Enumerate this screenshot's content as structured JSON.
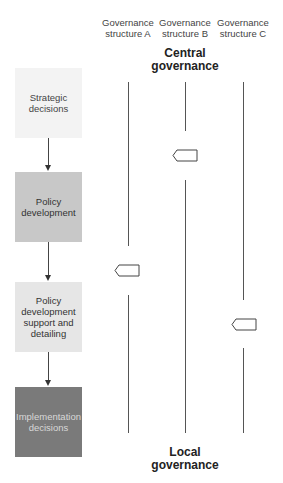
{
  "columns": [
    {
      "label_line1": "Governance",
      "label_line2": "structure A",
      "marker_level": "Policy development support and detailing (upper)"
    },
    {
      "label_line1": "Governance",
      "label_line2": "structure B",
      "marker_level": "Strategic decisions / Policy development"
    },
    {
      "label_line1": "Governance",
      "label_line2": "structure C",
      "marker_level": "Policy development support and detailing"
    }
  ],
  "central": {
    "line1": "Central",
    "line2": "governance"
  },
  "local": {
    "line1": "Local",
    "line2": "governance"
  },
  "boxes": [
    {
      "text_line1": "Strategic",
      "text_line2": "decisions",
      "bg": "#f3f3f3",
      "fg": "#444444"
    },
    {
      "text_line1": "Policy",
      "text_line2": "development",
      "bg": "#c8c8c8",
      "fg": "#333333"
    },
    {
      "text_line1": "Policy",
      "text_line2": "development",
      "text_line3": "support and",
      "text_line4": "detailing",
      "bg": "#e6e6e6",
      "fg": "#333333"
    },
    {
      "text_line1": "Implementation",
      "text_line2": "decisions",
      "bg": "#7a7a7a",
      "fg": "#d8d8d8"
    }
  ]
}
